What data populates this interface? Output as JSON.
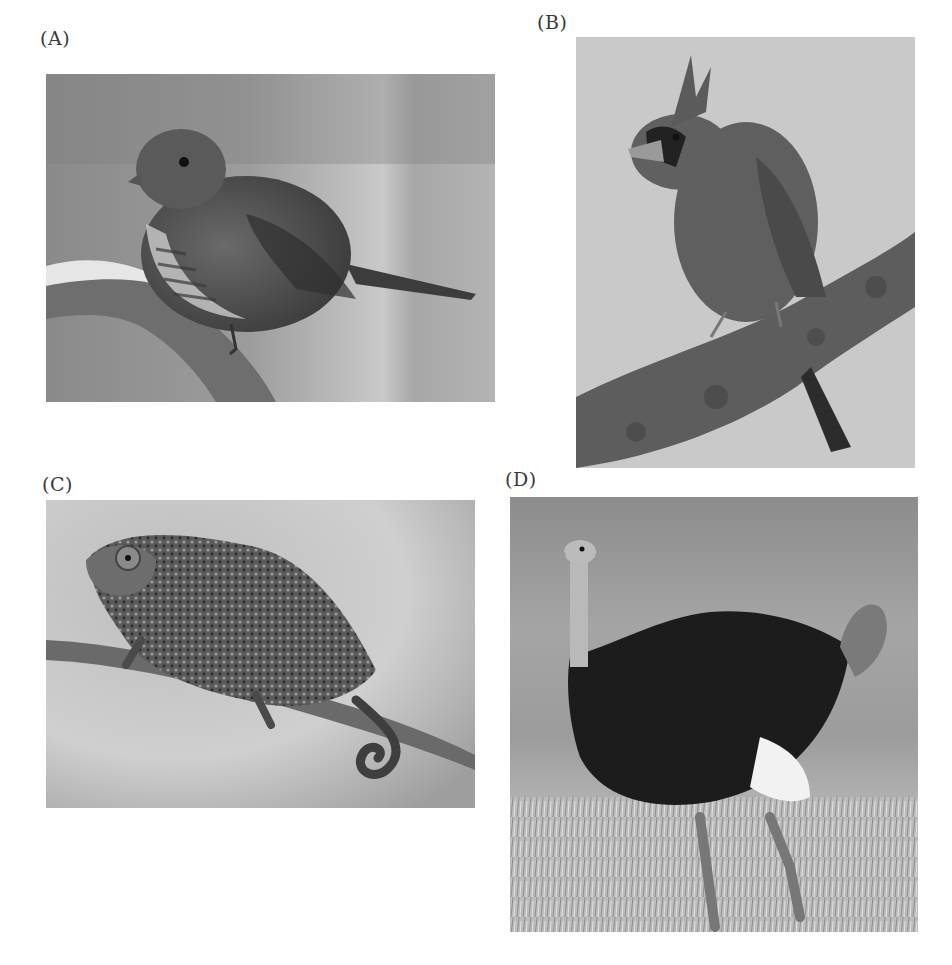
{
  "figure": {
    "panels": [
      {
        "id": "A",
        "label": "(A)",
        "subject": "sparrow perched on snowy branch",
        "tone": "grayscale"
      },
      {
        "id": "B",
        "label": "(B)",
        "subject": "crested cardinal perched on bark branch",
        "tone": "grayscale"
      },
      {
        "id": "C",
        "label": "(C)",
        "subject": "chameleon on twig with curled tail",
        "tone": "grayscale"
      },
      {
        "id": "D",
        "label": "(D)",
        "subject": "ostrich standing in grassland",
        "tone": "grayscale"
      }
    ],
    "caption_fragment": ""
  },
  "colors": {
    "background": "#ffffff",
    "label_text": "#3a3a3a",
    "photo_mid_gray": "#9a9a9a",
    "photo_light_gray": "#c8c8c8",
    "photo_dark": "#1e1e1e"
  }
}
